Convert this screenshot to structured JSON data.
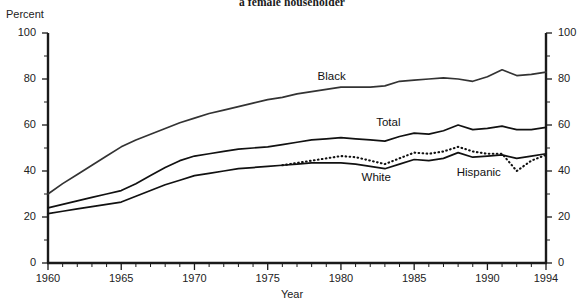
{
  "chart_data": {
    "type": "line",
    "title": "a female householder",
    "xlabel": "Year",
    "ylabel": "Percent",
    "xlim": [
      1960,
      1994
    ],
    "ylim": [
      0,
      100
    ],
    "grid": false,
    "legend_position": "inline-labels",
    "xticks": [
      "1960",
      "1965",
      "1970",
      "1975",
      "1980",
      "1985",
      "1990",
      "1994"
    ],
    "xtick_values": [
      1960,
      1965,
      1970,
      1975,
      1980,
      1985,
      1990,
      1994
    ],
    "yticks": [
      "0",
      "20",
      "40",
      "60",
      "80",
      "100"
    ],
    "ytick_values": [
      0,
      20,
      40,
      60,
      80,
      100
    ],
    "y_axis_right_ticks": [
      "0",
      "20",
      "40",
      "60",
      "80",
      "100"
    ],
    "series": [
      {
        "name": "Black",
        "style": "solid",
        "color": "#333333",
        "label_x": 1979.5,
        "label_y": 80.5,
        "x": [
          1960,
          1961,
          1962,
          1963,
          1964,
          1965,
          1966,
          1967,
          1968,
          1969,
          1970,
          1971,
          1972,
          1973,
          1974,
          1975,
          1976,
          1977,
          1978,
          1979,
          1980,
          1981,
          1982,
          1983,
          1984,
          1985,
          1986,
          1987,
          1988,
          1989,
          1990,
          1991,
          1992,
          1993,
          1994
        ],
        "values": [
          30.0,
          34.5,
          38.5,
          42.5,
          46.5,
          50.5,
          53.5,
          56.0,
          58.5,
          61.0,
          63.0,
          65.0,
          66.5,
          68.0,
          69.5,
          71.0,
          72.0,
          73.5,
          74.5,
          75.5,
          76.5,
          76.5,
          76.5,
          77.0,
          79.0,
          79.5,
          80.0,
          80.5,
          80.0,
          79.0,
          81.0,
          84.0,
          81.5,
          82.0,
          83.0
        ]
      },
      {
        "name": "Total",
        "style": "solid",
        "color": "#111111",
        "label_x": 1983.5,
        "label_y": 60.5,
        "x": [
          1960,
          1961,
          1962,
          1963,
          1964,
          1965,
          1966,
          1967,
          1968,
          1969,
          1970,
          1971,
          1972,
          1973,
          1974,
          1975,
          1976,
          1977,
          1978,
          1979,
          1980,
          1981,
          1982,
          1983,
          1984,
          1985,
          1986,
          1987,
          1988,
          1989,
          1990,
          1991,
          1992,
          1993,
          1994
        ],
        "values": [
          24.0,
          25.5,
          27.0,
          28.5,
          30.0,
          31.5,
          34.5,
          38.0,
          41.5,
          44.5,
          46.5,
          47.5,
          48.5,
          49.5,
          50.0,
          50.5,
          51.5,
          52.5,
          53.5,
          54.0,
          54.5,
          54.0,
          53.5,
          53.0,
          55.0,
          56.5,
          56.0,
          57.5,
          60.0,
          58.0,
          58.5,
          59.5,
          58.0,
          58.0,
          59.0
        ]
      },
      {
        "name": "White",
        "style": "solid",
        "color": "#111111",
        "label_x": 1982.5,
        "label_y": 36.5,
        "x": [
          1960,
          1961,
          1962,
          1963,
          1964,
          1965,
          1966,
          1967,
          1968,
          1969,
          1970,
          1971,
          1972,
          1973,
          1974,
          1975,
          1976,
          1977,
          1978,
          1979,
          1980,
          1981,
          1982,
          1983,
          1984,
          1985,
          1986,
          1987,
          1988,
          1989,
          1990,
          1991,
          1992,
          1993,
          1994
        ],
        "values": [
          21.5,
          22.5,
          23.5,
          24.5,
          25.5,
          26.5,
          29.0,
          31.5,
          34.0,
          36.0,
          38.0,
          39.0,
          40.0,
          41.0,
          41.5,
          42.0,
          42.5,
          43.0,
          43.5,
          43.5,
          43.5,
          43.0,
          42.0,
          41.0,
          43.0,
          45.0,
          44.5,
          45.5,
          48.0,
          46.0,
          46.5,
          47.0,
          45.5,
          46.5,
          47.5
        ]
      },
      {
        "name": "Hispanic",
        "style": "dotted",
        "color": "#111111",
        "label_x": 1989.0,
        "label_y": 38.5,
        "x": [
          1976,
          1977,
          1978,
          1979,
          1980,
          1981,
          1982,
          1983,
          1984,
          1985,
          1986,
          1987,
          1988,
          1989,
          1990,
          1991,
          1992,
          1993,
          1994
        ],
        "values": [
          42.5,
          43.5,
          44.5,
          45.5,
          46.5,
          46.0,
          44.5,
          43.0,
          45.5,
          48.0,
          47.5,
          48.5,
          50.5,
          48.5,
          47.5,
          47.5,
          40.0,
          44.5,
          47.0
        ]
      }
    ]
  },
  "labels": {
    "percent": "Percent",
    "year": "Year",
    "black": "Black",
    "total": "Total",
    "white": "White",
    "hispanic": "Hispanic"
  }
}
